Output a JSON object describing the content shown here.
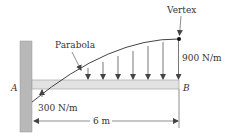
{
  "diagram": {
    "labels": {
      "vertex": "Vertex",
      "parabola": "Parabola",
      "load_end": "900 N/m",
      "load_start": "300 N/m",
      "point_a": "A",
      "point_b": "B",
      "span": "6 m"
    },
    "colors": {
      "wall": "#b5b5b5",
      "beam": "#e0e0e0",
      "line": "#444444",
      "text": "#333333"
    },
    "load": {
      "shape": "parabola",
      "start_value_n_per_m": 300,
      "end_value_n_per_m": 900,
      "span_m": 6,
      "vertex_at": "B"
    }
  }
}
